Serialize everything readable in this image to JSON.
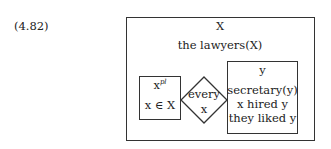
{
  "example_number": "(4.82)",
  "outer_box": {
    "referent": "X",
    "condition": "the lawyers(X)"
  },
  "left_box": {
    "referent": "x",
    "referent_superscript": "pl",
    "condition": "x ∈ X"
  },
  "quantifier": {
    "word": "every",
    "variable": "x"
  },
  "right_box": {
    "referent": "y",
    "conditions": [
      "secretary(y)",
      "x hired y",
      "they liked y"
    ]
  }
}
